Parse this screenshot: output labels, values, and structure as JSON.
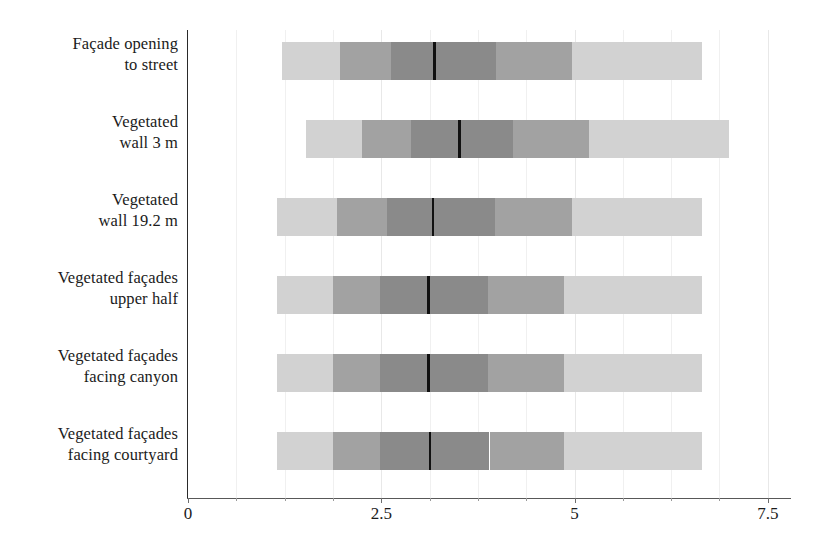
{
  "chart_data": {
    "type": "bar",
    "variant": "horizontal-stacked-distribution",
    "title": "",
    "subtitle": "",
    "xlabel": "",
    "ylabel": "",
    "xlim": [
      0,
      7.8
    ],
    "xticks": [
      0,
      2.5,
      5,
      7.5
    ],
    "xtick_labels": [
      "0",
      "2.5",
      "5",
      "7.5"
    ],
    "minor_xticks": [
      0.625,
      1.25,
      1.875,
      3.125,
      3.75,
      4.375,
      5.625,
      6.25,
      6.875
    ],
    "grid": true,
    "grid_axis": "x",
    "legend": null,
    "legend_position": "none",
    "orientation": "horizontal",
    "categories": [
      "Façade opening\nto street",
      "Vegetated\nwall 3 m",
      "Vegetated\nwall 19.2 m",
      "Vegetated façades\nupper half",
      "Vegetated façades\nfacing canyon",
      "Vegetated façades\nfacing courtyard"
    ],
    "segment_labels": [
      "lower whisker",
      "lower outer",
      "lower inner",
      "upper inner",
      "upper outer",
      "upper whisker"
    ],
    "segment_colors": [
      "#d2d2d2",
      "#a2a2a2",
      "#8a8a8a",
      "#8a8a8a",
      "#a2a2a2",
      "#d2d2d2"
    ],
    "median_color": "#111111",
    "rows": [
      {
        "category": "Façade opening to street",
        "min": 1.21,
        "q_low_outer": 1.96,
        "q_low_inner": 2.62,
        "median": 3.19,
        "q_high_inner": 3.99,
        "q_high_outer": 4.97,
        "max": 6.65
      },
      {
        "category": "Vegetated wall 3 m",
        "min": 1.52,
        "q_low_outer": 2.25,
        "q_low_inner": 2.89,
        "median": 3.51,
        "q_high_inner": 4.2,
        "q_high_outer": 5.19,
        "max": 7.0
      },
      {
        "category": "Vegetated wall 19.2 m",
        "min": 1.15,
        "q_low_outer": 1.93,
        "q_low_inner": 2.58,
        "median": 3.17,
        "q_high_inner": 3.97,
        "q_high_outer": 4.97,
        "max": 6.65
      },
      {
        "category": "Vegetated façades upper half",
        "min": 1.15,
        "q_low_outer": 1.87,
        "q_low_inner": 2.49,
        "median": 3.11,
        "q_high_inner": 3.88,
        "q_high_outer": 4.86,
        "max": 6.65
      },
      {
        "category": "Vegetated façades facing canyon",
        "min": 1.15,
        "q_low_outer": 1.87,
        "q_low_inner": 2.49,
        "median": 3.11,
        "q_high_inner": 3.88,
        "q_high_outer": 4.86,
        "max": 6.65
      },
      {
        "category": "Vegetated façades facing courtyard",
        "min": 1.15,
        "q_low_outer": 1.87,
        "q_low_inner": 2.49,
        "median": 3.13,
        "q_high_inner": 3.9,
        "q_high_outer": 4.86,
        "max": 6.65
      }
    ]
  },
  "axis": {
    "tick_labels": [
      "0",
      "2.5",
      "5",
      "7.5"
    ]
  },
  "labels": {
    "items": [
      "Façade opening\nto street",
      "Vegetated\nwall 3 m",
      "Vegetated\nwall 19.2 m",
      "Vegetated façades\nupper half",
      "Vegetated façades\nfacing canyon",
      "Vegetated façades\nfacing courtyard"
    ]
  }
}
